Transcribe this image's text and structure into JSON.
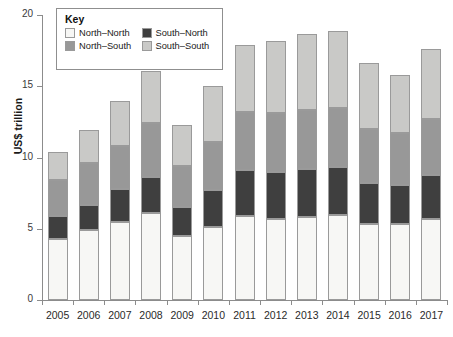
{
  "chart_data": {
    "type": "bar",
    "subtype": "stacked-bar",
    "title": "",
    "xlabel": "",
    "ylabel": "US$ trillion",
    "ylim": [
      0,
      20
    ],
    "yticks": [
      0,
      5,
      10,
      15,
      20
    ],
    "grid": false,
    "legend_position": "top-left",
    "legend_title": "Key",
    "categories": [
      "2005",
      "2006",
      "2007",
      "2008",
      "2009",
      "2010",
      "2011",
      "2012",
      "2013",
      "2014",
      "2015",
      "2016",
      "2017"
    ],
    "series": [
      {
        "name": "North–North",
        "color": "#f7f7f5",
        "values": [
          4.3,
          4.9,
          5.5,
          6.1,
          4.5,
          5.1,
          5.9,
          5.7,
          5.8,
          6.0,
          5.3,
          5.3,
          5.7
        ]
      },
      {
        "name": "South–North",
        "color": "#3f3f3f",
        "values": [
          1.6,
          1.8,
          2.3,
          2.5,
          2.0,
          2.6,
          3.2,
          3.3,
          3.4,
          3.3,
          2.9,
          2.8,
          3.1
        ]
      },
      {
        "name": "North–South",
        "color": "#989898",
        "values": [
          2.5,
          2.9,
          3.0,
          3.8,
          2.9,
          3.4,
          4.1,
          4.1,
          4.1,
          4.2,
          3.8,
          3.6,
          3.9
        ]
      },
      {
        "name": "South–South",
        "color": "#c9c9c7",
        "values": [
          2.0,
          2.3,
          3.2,
          3.7,
          2.9,
          3.9,
          4.7,
          5.1,
          5.4,
          5.4,
          4.6,
          4.1,
          4.9
        ]
      }
    ],
    "totals": [
      10.4,
      11.9,
      14.0,
      16.1,
      12.3,
      15.0,
      17.9,
      18.2,
      18.7,
      18.9,
      16.6,
      15.8,
      17.6
    ]
  },
  "axes": {
    "y_title": "US$ trillion",
    "y_tick_labels": [
      "0",
      "5",
      "10",
      "15",
      "20"
    ],
    "x_tick_labels": [
      "2005",
      "2006",
      "2007",
      "2008",
      "2009",
      "2010",
      "2011",
      "2012",
      "2013",
      "2014",
      "2015",
      "2016",
      "2017"
    ]
  },
  "legend": {
    "title": "Key",
    "items": [
      {
        "label": "North–North",
        "color": "#f7f7f5"
      },
      {
        "label": "South–North",
        "color": "#3f3f3f"
      },
      {
        "label": "North–South",
        "color": "#989898"
      },
      {
        "label": "South–South",
        "color": "#c9c9c7"
      }
    ]
  }
}
